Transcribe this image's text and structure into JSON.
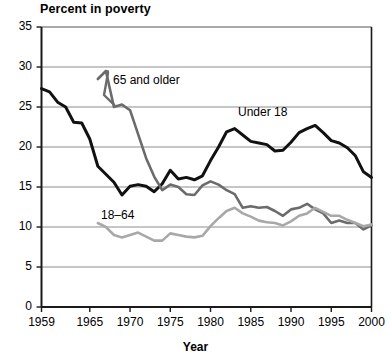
{
  "chart_data": {
    "type": "line",
    "title": "Percent in poverty",
    "xlabel": "Year",
    "ylabel": "",
    "xlim": [
      1959,
      2000
    ],
    "ylim": [
      0,
      35
    ],
    "ytick_values": [
      0,
      5,
      10,
      15,
      20,
      25,
      30,
      35
    ],
    "ytick_labels": [
      "0",
      "5",
      "10",
      "15",
      "20",
      "25",
      "30",
      "35"
    ],
    "xtick_values": [
      1959,
      1965,
      1970,
      1975,
      1980,
      1985,
      1990,
      1995,
      2000
    ],
    "xtick_labels": [
      "1959",
      "1965",
      "1970",
      "1975",
      "1980",
      "1985",
      "1990",
      "1995",
      "2000"
    ],
    "grid": "horizontal",
    "legend_position": "inline-annotations",
    "series": [
      {
        "name": "Under 18",
        "color": "#111111",
        "x": [
          1959,
          1960,
          1961,
          1962,
          1963,
          1964,
          1965,
          1966,
          1967,
          1968,
          1969,
          1970,
          1971,
          1972,
          1973,
          1974,
          1975,
          1976,
          1977,
          1978,
          1979,
          1980,
          1981,
          1982,
          1983,
          1984,
          1985,
          1986,
          1987,
          1988,
          1989,
          1990,
          1991,
          1992,
          1993,
          1994,
          1995,
          1996,
          1997,
          1998,
          1999,
          2000
        ],
        "values": [
          27.3,
          26.9,
          25.6,
          25.0,
          23.1,
          23.0,
          21.0,
          17.6,
          16.6,
          15.6,
          14.0,
          15.1,
          15.3,
          15.1,
          14.4,
          15.4,
          17.1,
          16.0,
          16.2,
          15.9,
          16.4,
          18.3,
          20.0,
          21.9,
          22.3,
          21.5,
          20.7,
          20.5,
          20.3,
          19.5,
          19.6,
          20.6,
          21.8,
          22.3,
          22.7,
          21.8,
          20.8,
          20.5,
          19.9,
          18.9,
          16.9,
          16.2
        ]
      },
      {
        "name": "65 and older",
        "color": "#6b6b6b",
        "x": [
          1966,
          1967,
          1968,
          1969,
          1970,
          1971,
          1972,
          1973,
          1974,
          1975,
          1976,
          1977,
          1978,
          1979,
          1980,
          1981,
          1982,
          1983,
          1984,
          1985,
          1986,
          1987,
          1988,
          1989,
          1990,
          1991,
          1992,
          1993,
          1994,
          1995,
          1996,
          1997,
          1998,
          1999,
          2000
        ],
        "values": [
          28.5,
          29.5,
          25.0,
          25.3,
          24.6,
          21.6,
          18.6,
          16.3,
          14.6,
          15.3,
          15.0,
          14.1,
          14.0,
          15.2,
          15.7,
          15.3,
          14.6,
          14.1,
          12.4,
          12.6,
          12.4,
          12.5,
          12.0,
          11.4,
          12.2,
          12.4,
          12.9,
          12.2,
          11.7,
          10.5,
          10.8,
          10.5,
          10.5,
          9.7,
          10.2
        ]
      },
      {
        "name": "18–64",
        "color": "#a8a8a8",
        "x": [
          1966,
          1967,
          1968,
          1969,
          1970,
          1971,
          1972,
          1973,
          1974,
          1975,
          1976,
          1977,
          1978,
          1979,
          1980,
          1981,
          1982,
          1983,
          1984,
          1985,
          1986,
          1987,
          1988,
          1989,
          1990,
          1991,
          1992,
          1993,
          1994,
          1995,
          1996,
          1997,
          1998,
          1999,
          2000
        ],
        "values": [
          10.5,
          10.0,
          9.0,
          8.7,
          9.0,
          9.3,
          8.8,
          8.3,
          8.3,
          9.2,
          9.0,
          8.8,
          8.7,
          8.9,
          10.1,
          11.1,
          12.0,
          12.4,
          11.7,
          11.3,
          10.8,
          10.6,
          10.5,
          10.2,
          10.7,
          11.4,
          11.7,
          12.4,
          11.9,
          11.4,
          11.4,
          10.9,
          10.5,
          10.1,
          10.3
        ]
      }
    ]
  },
  "chart": {
    "title": "Percent in poverty",
    "xaxis_title": "Year",
    "annotations": {
      "older": "65 and older",
      "under18": "Under 18",
      "adults": "18–64"
    }
  }
}
